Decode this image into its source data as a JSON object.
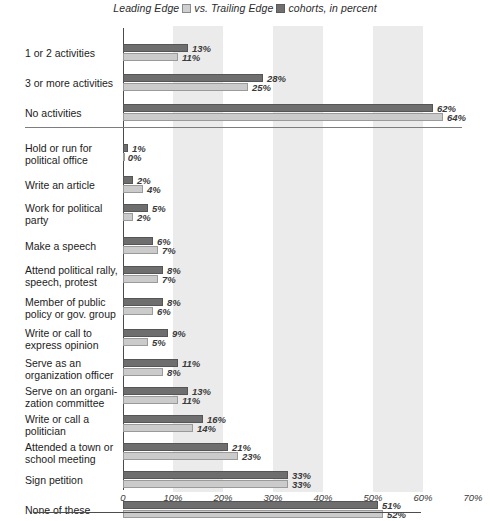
{
  "legend": {
    "prefix": "Leading Edge",
    "middle": "vs. Trailing Edge",
    "suffix": "cohorts, in percent",
    "light_swatch_name": "leading-edge-swatch",
    "dark_swatch_name": "trailing-edge-swatch",
    "light_color": "#cfcfcf",
    "dark_color": "#6f6f6f"
  },
  "chart_data": {
    "type": "bar",
    "orientation": "horizontal",
    "xlabel": "",
    "ylabel": "",
    "xlim": [
      0,
      70
    ],
    "xticks": [
      "0",
      "10%",
      "20%",
      "30%",
      "40%",
      "50%",
      "60%",
      "70%"
    ],
    "xtick_values": [
      0,
      10,
      20,
      30,
      40,
      50,
      60,
      70
    ],
    "grid": "alternating vertical shaded bands at 10-20%, 30-40%, 50-60%",
    "legend_position": "top-center",
    "series": [
      {
        "name": "Trailing Edge",
        "color": "#6e6e6e",
        "position": "upper bar in each pair"
      },
      {
        "name": "Leading Edge",
        "color": "#cbcbcb",
        "position": "lower bar in each pair"
      }
    ],
    "groups": [
      {
        "name": "summary",
        "categories": [
          "1 or 2 activities",
          "3 or more activities",
          "No activities"
        ],
        "trailing_edge": [
          13,
          28,
          62
        ],
        "leading_edge": [
          11,
          25,
          64
        ]
      },
      {
        "name": "activities",
        "categories": [
          "Hold or run for political office",
          "Write an article",
          "Work for political party",
          "Make a speech",
          "Attend political rally, speech, protest",
          "Member of public policy or gov. group",
          "Write or call to express opinion",
          "Serve as an organization officer",
          "Serve on an organization committee",
          "Write or call a politician",
          "Attended a town or school meeting",
          "Sign petition",
          "None of these"
        ],
        "trailing_edge": [
          1,
          2,
          5,
          6,
          8,
          8,
          9,
          11,
          13,
          16,
          21,
          33,
          51
        ],
        "leading_edge": [
          0,
          4,
          2,
          7,
          7,
          6,
          5,
          8,
          11,
          14,
          23,
          33,
          52
        ]
      }
    ]
  },
  "rows": [
    {
      "label_lines": [
        "1 or 2 activities"
      ],
      "dark": 13,
      "light": 11,
      "dark_label": "13%",
      "light_label": "11%"
    },
    {
      "label_lines": [
        "3 or more activities"
      ],
      "dark": 28,
      "light": 25,
      "dark_label": "28%",
      "light_label": "25%"
    },
    {
      "label_lines": [
        "No activities"
      ],
      "dark": 62,
      "light": 64,
      "dark_label": "62%",
      "light_label": "64%"
    },
    {
      "label_lines": [
        "Hold or run for",
        "political office"
      ],
      "dark": 1,
      "light": 0,
      "dark_label": "1%",
      "light_label": "0%"
    },
    {
      "label_lines": [
        "Write an article"
      ],
      "dark": 2,
      "light": 4,
      "dark_label": "2%",
      "light_label": "4%"
    },
    {
      "label_lines": [
        "Work for political",
        "party"
      ],
      "dark": 5,
      "light": 2,
      "dark_label": "5%",
      "light_label": "2%"
    },
    {
      "label_lines": [
        "Make a speech"
      ],
      "dark": 6,
      "light": 7,
      "dark_label": "6%",
      "light_label": "7%"
    },
    {
      "label_lines": [
        "Attend political rally,",
        "speech, protest"
      ],
      "dark": 8,
      "light": 7,
      "dark_label": "8%",
      "light_label": "7%"
    },
    {
      "label_lines": [
        "Member of public",
        "policy or gov. group"
      ],
      "dark": 8,
      "light": 6,
      "dark_label": "8%",
      "light_label": "6%"
    },
    {
      "label_lines": [
        "Write or call to",
        "express opinion"
      ],
      "dark": 9,
      "light": 5,
      "dark_label": "9%",
      "light_label": "5%"
    },
    {
      "label_lines": [
        "Serve as an",
        "organization officer"
      ],
      "dark": 11,
      "light": 8,
      "dark_label": "11%",
      "light_label": "8%"
    },
    {
      "label_lines": [
        "Serve on an organi-",
        "zation committee"
      ],
      "dark": 13,
      "light": 11,
      "dark_label": "13%",
      "light_label": "11%"
    },
    {
      "label_lines": [
        "Write or call a",
        "politician"
      ],
      "dark": 16,
      "light": 14,
      "dark_label": "16%",
      "light_label": "14%"
    },
    {
      "label_lines": [
        "Attended a town or",
        "school meeting"
      ],
      "dark": 21,
      "light": 23,
      "dark_label": "21%",
      "light_label": "23%"
    },
    {
      "label_lines": [
        "Sign petition"
      ],
      "dark": 33,
      "light": 33,
      "dark_label": "33%",
      "light_label": "33%"
    },
    {
      "label_lines": [
        "None of these"
      ],
      "dark": 51,
      "light": 52,
      "dark_label": "51%",
      "light_label": "52%"
    }
  ]
}
